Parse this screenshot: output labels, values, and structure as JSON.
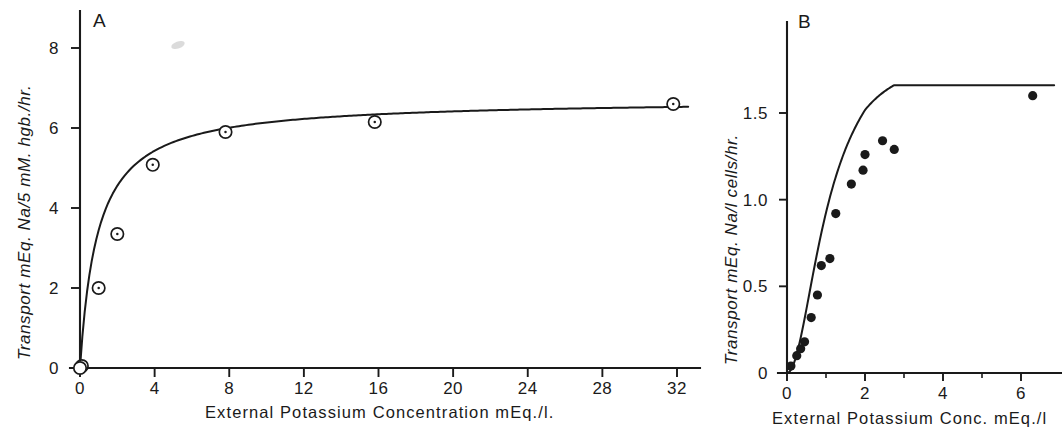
{
  "figure": {
    "background_color": "#ffffff",
    "ink_color": "#1a1a1a",
    "panel_count": 2
  },
  "chart_data": [
    {
      "type": "scatter",
      "panel_label": "A",
      "title": "",
      "xlabel": "External  Potassium  Concentration  mEq./l.",
      "ylabel": "Transport  mEq.  Na/5 mM. hgb./hr.",
      "xlim": [
        0,
        33.5
      ],
      "ylim": [
        0,
        8.8
      ],
      "xticks": [
        0,
        4,
        8,
        12,
        16,
        20,
        24,
        28,
        32
      ],
      "xticklabels": [
        "0",
        "4",
        "8",
        "12",
        "16",
        "20",
        "24",
        "28",
        "32"
      ],
      "yticks": [
        0,
        2,
        4,
        6,
        8
      ],
      "yticklabels": [
        "0",
        "2",
        "4",
        "6",
        "8"
      ],
      "grid": false,
      "legend": "none",
      "marker": "open-circle",
      "x": [
        0.1,
        1.0,
        2.0,
        3.9,
        7.8,
        15.8,
        31.8
      ],
      "y": [
        0.05,
        2.0,
        3.35,
        5.08,
        5.9,
        6.15,
        6.6
      ],
      "fit_curve": {
        "model": "michaelis-menten",
        "vmax": 6.72,
        "km": 0.95,
        "note": "saturating hyperbola through the open-circle points"
      }
    },
    {
      "type": "scatter",
      "panel_label": "B",
      "title": "",
      "xlabel": "External  Potassium  Conc.  mEq./l",
      "ylabel": "Transport  mEq.  Na/l cells/hr.",
      "xlim": [
        0,
        7.0
      ],
      "ylim": [
        0,
        1.85
      ],
      "xticks": [
        0,
        1,
        2,
        3,
        4,
        5,
        6
      ],
      "xticklabels": [
        "0",
        "",
        "2",
        "",
        "4",
        "",
        "6"
      ],
      "yticks": [
        0,
        0.5,
        1.0,
        1.5
      ],
      "yticklabels": [
        "0",
        "0.5",
        "1.0",
        "1.5"
      ],
      "grid": false,
      "legend": "none",
      "marker": "filled-circle",
      "x": [
        0.1,
        0.25,
        0.35,
        0.45,
        0.62,
        0.78,
        0.88,
        1.1,
        1.25,
        1.65,
        1.95,
        2.0,
        2.45,
        2.75,
        6.3
      ],
      "y": [
        0.04,
        0.1,
        0.14,
        0.18,
        0.32,
        0.45,
        0.62,
        0.66,
        0.92,
        1.09,
        1.17,
        1.26,
        1.34,
        1.29,
        1.6
      ],
      "fit_curve": {
        "model": "sigmoid-saturating",
        "vmax": 1.66,
        "note": "S-shaped saturating curve through the filled points"
      }
    }
  ]
}
